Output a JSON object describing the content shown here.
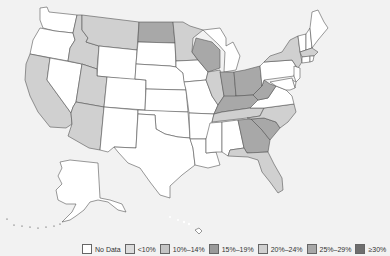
{
  "map": {
    "type": "choropleth",
    "region": "United States",
    "states": {
      "WA": "No Data",
      "OR": "No Data",
      "CA": "20%–24%",
      "NV": "No Data",
      "ID": "20%–24%",
      "MT": "20%–24%",
      "WY": "No Data",
      "UT": "20%–24%",
      "AZ": "20%–24%",
      "CO": "No Data",
      "NM": "No Data",
      "ND": "25%–29%",
      "SD": "No Data",
      "NE": "No Data",
      "KS": "No Data",
      "OK": "No Data",
      "TX": "No Data",
      "MN": "20%–24%",
      "IA": "No Data",
      "MO": "No Data",
      "AR": "No Data",
      "LA": "No Data",
      "WI": "25%–29%",
      "IL": "20%–24%",
      "MI": "No Data",
      "IN": "25%–29%",
      "OH": "25%–29%",
      "KY": "25%–29%",
      "TN": "20%–24%",
      "MS": "No Data",
      "AL": "No Data",
      "GA": "25%–29%",
      "FL": "20%–24%",
      "SC": "25%–29%",
      "NC": "20%–24%",
      "VA": "No Data",
      "WV": "25%–29%",
      "PA": "No Data",
      "NY": "20%–24%",
      "ME": "No Data",
      "NH": "No Data",
      "VT": "No Data",
      "MA": "20%–24%",
      "CT": "No Data",
      "RI": "No Data",
      "NJ": "No Data",
      "DE": "No Data",
      "MD": "No Data",
      "AK": "No Data",
      "HI": "No Data"
    }
  },
  "legend": {
    "items": [
      {
        "label": "No Data",
        "color": "#ffffff"
      },
      {
        "label": "<10%",
        "color": "#dcdcdc"
      },
      {
        "label": "10%–14%",
        "color": "#c4c4c4"
      },
      {
        "label": "15%–19%",
        "color": "#9a9a9a"
      },
      {
        "label": "20%–24%",
        "color": "#d0d0d0"
      },
      {
        "label": "25%–29%",
        "color": "#a8a8a8"
      },
      {
        "label": "≥30%",
        "color": "#6e6e6e"
      }
    ]
  }
}
